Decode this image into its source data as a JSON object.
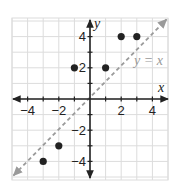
{
  "chart_data": {
    "type": "scatter",
    "title": "",
    "xlabel": "x",
    "ylabel": "y",
    "xlim": [
      -5,
      5
    ],
    "ylim": [
      -5,
      5
    ],
    "grid": true,
    "x_ticks": [
      -4,
      -2,
      2,
      4
    ],
    "y_ticks": [
      4,
      2,
      -2,
      -4
    ],
    "x_tick_labels": [
      "−4",
      "−2",
      "2",
      "4"
    ],
    "y_tick_labels": [
      "4",
      "2",
      "−2",
      "−4"
    ],
    "series": [
      {
        "name": "points",
        "points": [
          {
            "x": -3,
            "y": -4
          },
          {
            "x": -2,
            "y": -3
          },
          {
            "x": -1,
            "y": 2
          },
          {
            "x": 1,
            "y": 2
          },
          {
            "x": 2,
            "y": 4
          },
          {
            "x": 3,
            "y": 4
          }
        ],
        "color": "#222222"
      }
    ],
    "reference_line": {
      "label": "y = x",
      "equation": "y = x",
      "style": "dashed",
      "color": "#9a9a9a"
    },
    "colors": {
      "grid": "#dcdcdc",
      "axis": "#222222",
      "point": "#222222",
      "reference": "#9a9a9a"
    }
  },
  "labels": {
    "x_axis": "x",
    "y_axis": "y",
    "line": "y = x"
  }
}
